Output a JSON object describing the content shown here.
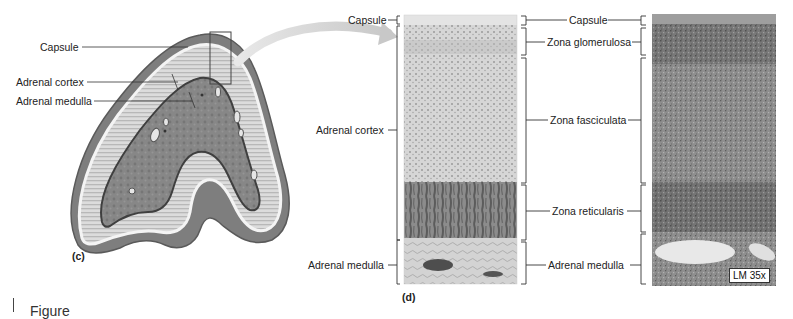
{
  "panel_c": {
    "letter": "(c)",
    "labels": {
      "capsule": "Capsule",
      "adrenal_cortex": "Adrenal cortex",
      "adrenal_medulla": "Adrenal medulla"
    }
  },
  "panel_d": {
    "letter": "(d)",
    "left_labels": {
      "capsule": "Capsule",
      "adrenal_cortex": "Adrenal cortex",
      "adrenal_medulla": "Adrenal medulla"
    },
    "zone_labels": {
      "capsule": "Capsule",
      "zona_glomerulosa": "Zona glomerulosa",
      "zona_fasciculata": "Zona fasciculata",
      "zona_reticularis": "Zona reticularis",
      "adrenal_medulla": "Adrenal medulla"
    }
  },
  "micrograph": {
    "magnification": "LM 35x"
  },
  "caption": {
    "text": "Figure"
  },
  "colors": {
    "cortex_light": "#d9d9d9",
    "cortex_stripe": "#bdbdbd",
    "medulla": "#8a8a8a",
    "outer_tissue": "#7d7d7d",
    "reticularis": "#6e6e6e",
    "micrograph_dark": "#5a5a5a"
  }
}
